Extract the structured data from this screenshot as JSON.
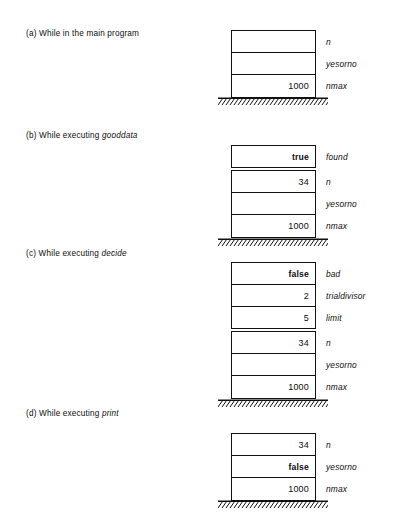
{
  "figure": {
    "colors": {
      "ink": "#111111",
      "background": "#ffffff"
    },
    "panels": [
      {
        "id": "panel-a",
        "tag": "(a)",
        "caption_prefix": "While in the main program",
        "caption_proc": "",
        "frames": [
          {
            "name": "main-frame",
            "cells": [
              {
                "value": "",
                "label": "n"
              },
              {
                "value": "",
                "label": "yesorno"
              },
              {
                "value": "1000",
                "label": "nmax"
              }
            ]
          }
        ]
      },
      {
        "id": "panel-b",
        "tag": "(b)",
        "caption_prefix": "While executing",
        "caption_proc": "gooddata",
        "frames": [
          {
            "name": "gooddata-frame",
            "cells": [
              {
                "value": "true",
                "label": "found",
                "bold": true
              }
            ]
          },
          {
            "name": "main-frame",
            "cells": [
              {
                "value": "34",
                "label": "n"
              },
              {
                "value": "",
                "label": "yesorno"
              },
              {
                "value": "1000",
                "label": "nmax"
              }
            ]
          }
        ]
      },
      {
        "id": "panel-c",
        "tag": "(c)",
        "caption_prefix": "While executing",
        "caption_proc": "decide",
        "frames": [
          {
            "name": "decide-frame",
            "cells": [
              {
                "value": "false",
                "label": "bad",
                "bold": true
              },
              {
                "value": "2",
                "label": "trialdivisor"
              },
              {
                "value": "5",
                "label": "limit"
              }
            ]
          },
          {
            "name": "main-frame",
            "cells": [
              {
                "value": "34",
                "label": "n"
              },
              {
                "value": "",
                "label": "yesorno"
              },
              {
                "value": "1000",
                "label": "nmax"
              }
            ]
          }
        ]
      },
      {
        "id": "panel-d",
        "tag": "(d)",
        "caption_prefix": "While executing",
        "caption_proc": "print",
        "frames": [
          {
            "name": "main-frame",
            "cells": [
              {
                "value": "34",
                "label": "n"
              },
              {
                "value": "false",
                "label": "yesorno",
                "bold": true
              },
              {
                "value": "1000",
                "label": "nmax"
              }
            ]
          }
        ]
      }
    ]
  }
}
